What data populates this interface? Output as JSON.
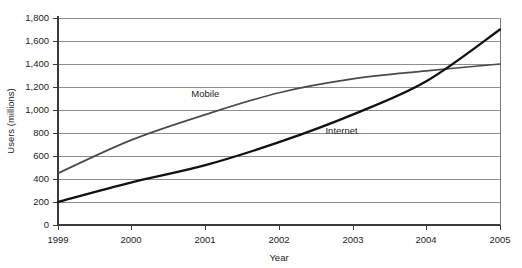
{
  "chart_data": {
    "type": "line",
    "title": "",
    "xlabel": "Year",
    "ylabel": "Users (millions)",
    "x": [
      1999,
      2000,
      2001,
      2002,
      2003,
      2004,
      2005
    ],
    "categories": [
      "1999",
      "2000",
      "2001",
      "2002",
      "2003",
      "2004",
      "2005"
    ],
    "xlim": [
      1999,
      2005
    ],
    "ylim": [
      0,
      1800
    ],
    "ytick_values": [
      0,
      200,
      400,
      600,
      800,
      1000,
      1200,
      1400,
      1600,
      1800
    ],
    "ytick_labels": [
      "0",
      "200",
      "400",
      "600",
      "800",
      "1,000",
      "1,200",
      "1,400",
      "1,600",
      "1,800"
    ],
    "grid": true,
    "grid_axis": "y",
    "legend": "inline-labels",
    "series": [
      {
        "name": "Mobile",
        "color": "#4a4a4a",
        "values": [
          450,
          740,
          960,
          1150,
          1270,
          1340,
          1400
        ],
        "label_x": 2001,
        "label_y": 1110
      },
      {
        "name": "Internet",
        "color": "#111111",
        "values": [
          200,
          370,
          520,
          720,
          960,
          1250,
          1700
        ],
        "label_x": 2002.85,
        "label_y": 790
      }
    ],
    "annotations": [
      {
        "text": "Mobile",
        "series": "Mobile"
      },
      {
        "text": "Internet",
        "series": "Internet"
      }
    ]
  },
  "axis": {
    "y_title": "Users (millions)",
    "x_title": "Year"
  },
  "ticks": {
    "y": [
      "1,800",
      "1,600",
      "1,400",
      "1,200",
      "1,000",
      "800",
      "600",
      "400",
      "200",
      "0"
    ],
    "x": [
      "1999",
      "2000",
      "2001",
      "2002",
      "2003",
      "2004",
      "2005"
    ]
  },
  "labels": {
    "mobile": "Mobile",
    "internet": "Internet"
  },
  "colors": {
    "mobile_line": "#4a4a4a",
    "internet_line": "#111111",
    "gridline": "#8d8d8d",
    "background": "#ffffff"
  }
}
